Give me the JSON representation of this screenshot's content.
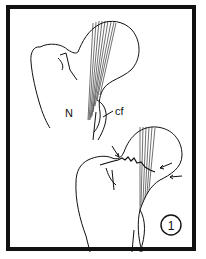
{
  "figure": {
    "panel_number": "1",
    "labels": {
      "neck": "N",
      "cf": "cf"
    }
  },
  "colors": {
    "line": "#111111",
    "background": "#ffffff",
    "border": "#111111"
  }
}
